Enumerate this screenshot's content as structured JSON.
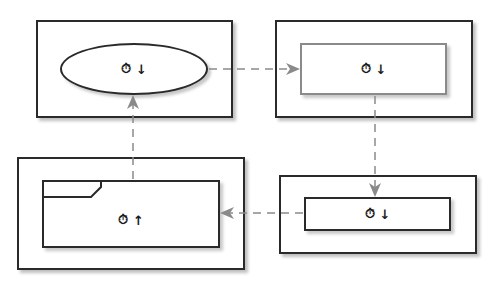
{
  "diagram": {
    "nodes": [
      {
        "id": "start",
        "shape": "ellipse",
        "icon": "timer-icon",
        "glyph": "↓",
        "direction": "down"
      },
      {
        "id": "step2",
        "shape": "rectangle-gray-border",
        "icon": "timer-icon",
        "glyph": "↓",
        "direction": "down"
      },
      {
        "id": "step3",
        "shape": "rectangle",
        "icon": "timer-icon",
        "glyph": "↓",
        "direction": "down"
      },
      {
        "id": "step4",
        "shape": "folder-tab-rectangle",
        "icon": "timer-icon",
        "glyph": "↑",
        "direction": "up"
      }
    ],
    "edges": [
      {
        "from": "start",
        "to": "step2",
        "style": "dashed"
      },
      {
        "from": "step2",
        "to": "step3",
        "style": "dashed"
      },
      {
        "from": "step3",
        "to": "step4",
        "style": "dashed"
      },
      {
        "from": "step4",
        "to": "start",
        "style": "dashed"
      }
    ],
    "colors": {
      "border": "#2a2a2a",
      "edge": "#8a8a8a",
      "gray_border": "#8a8a8a"
    }
  }
}
